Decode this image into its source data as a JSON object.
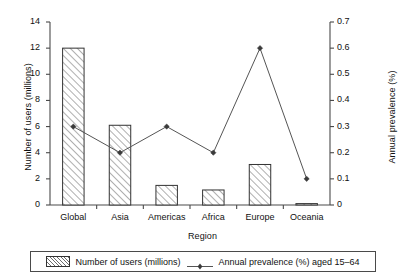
{
  "chart_data": {
    "type": "bar",
    "title": "",
    "subtitle": "",
    "xlabel": "Region",
    "ylabel": "Number of users (millions)",
    "y2label": "Annual prevalence (%)",
    "categories": [
      "Global",
      "Asia",
      "Americas",
      "Africa",
      "Europe",
      "Oceania"
    ],
    "grid": false,
    "legend_position": "bottom",
    "ylim": [
      0,
      14
    ],
    "y2lim": [
      0,
      0.7
    ],
    "yticks": [
      "0",
      "2",
      "4",
      "6",
      "8",
      "10",
      "12",
      "14"
    ],
    "ytick_values": [
      0,
      2,
      4,
      6,
      8,
      10,
      12,
      14
    ],
    "y2ticks": [
      "0",
      "0.1",
      "0.2",
      "0.3",
      "0.4",
      "0.5",
      "0.6",
      "0.7"
    ],
    "y2tick_values": [
      0,
      0.1,
      0.2,
      0.3,
      0.4,
      0.5,
      0.6,
      0.7
    ],
    "series": [
      {
        "name": "Number of users (millions)",
        "type": "bar",
        "axis": "left",
        "values": [
          12.0,
          6.1,
          1.5,
          1.15,
          3.1,
          0.05
        ]
      },
      {
        "name": "Annual prevalence (%) aged 15–64",
        "type": "line",
        "axis": "right",
        "values": [
          0.3,
          0.2,
          0.3,
          0.2,
          0.6,
          0.1
        ]
      }
    ]
  },
  "legend": {
    "items": [
      {
        "label": "Number of users (millions)",
        "marker": "hatched-swatch"
      },
      {
        "label": "Annual prevalence (%) aged 15–64",
        "marker": "line-diamond"
      }
    ]
  },
  "colors": {
    "axis": "#4a4a4a",
    "bar_border": "#333333",
    "bar_hatch": "#6d6d6d",
    "line": "#555555",
    "marker": "#3a3a3a",
    "text": "#111111",
    "background": "#ffffff"
  }
}
